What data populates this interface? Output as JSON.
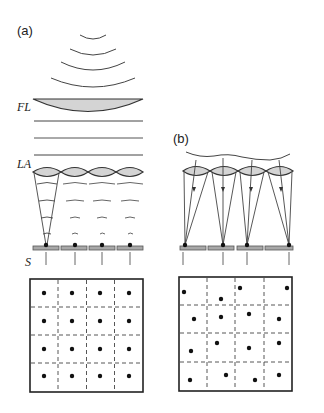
{
  "panel_a": {
    "label": "(a)",
    "fl_label": "FL",
    "la_label": "LA",
    "s_label": "S",
    "lens_count": 4,
    "grid": {
      "rows": 4,
      "cols": 4,
      "dots": "regular-centered"
    }
  },
  "panel_b": {
    "label": "(b)",
    "lens_count": 4,
    "grid": {
      "rows": 4,
      "cols": 4,
      "dots": "irregular"
    }
  },
  "colors": {
    "stroke": "#333333",
    "lens_fill": "#d4d4d4",
    "sensor_fill": "#a8a8a8",
    "dot": "#111111"
  }
}
